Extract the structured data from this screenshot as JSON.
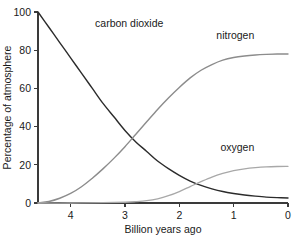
{
  "chart_data": {
    "type": "line",
    "title": "",
    "subtitle": "",
    "xlabel": "Billion years ago",
    "ylabel": "Percentage of atmosphere",
    "xlim": [
      4.6,
      0.0
    ],
    "ylim": [
      0,
      100
    ],
    "x_ticks": [
      4,
      3,
      2,
      1,
      0
    ],
    "x_tick_labels": [
      "4",
      "3",
      "2",
      "1",
      "0"
    ],
    "y_ticks": [
      0,
      20,
      40,
      60,
      80,
      100
    ],
    "y_tick_labels": [
      "0",
      "20",
      "40",
      "60",
      "80",
      "100"
    ],
    "x_axis_reversed": true,
    "grid": false,
    "legend": "inline-curve-labels",
    "background": "#ffffff",
    "series": [
      {
        "name": "carbon dioxide",
        "label": "carbon dioxide",
        "color": "#2b2b2b",
        "stroke_width": 1.4,
        "label_x": 3.55,
        "label_y": 92,
        "x": [
          4.6,
          4.4,
          4.2,
          4.0,
          3.8,
          3.6,
          3.4,
          3.2,
          3.0,
          2.8,
          2.6,
          2.4,
          2.2,
          2.0,
          1.8,
          1.6,
          1.4,
          1.2,
          1.0,
          0.8,
          0.6,
          0.4,
          0.2,
          0.0
        ],
        "y": [
          100,
          92,
          84,
          76,
          68,
          60,
          52,
          45,
          38,
          32,
          27,
          22,
          18,
          14.5,
          11.5,
          9.2,
          7.4,
          6.0,
          5.0,
          4.2,
          3.6,
          3.1,
          2.8,
          2.6
        ]
      },
      {
        "name": "nitrogen",
        "label": "nitrogen",
        "color": "#8c8c8c",
        "stroke_width": 1.4,
        "label_x": 0.62,
        "label_y": 86,
        "x": [
          4.6,
          4.4,
          4.2,
          4.0,
          3.8,
          3.6,
          3.4,
          3.2,
          3.0,
          2.8,
          2.6,
          2.4,
          2.2,
          2.0,
          1.8,
          1.6,
          1.4,
          1.2,
          1.0,
          0.8,
          0.6,
          0.4,
          0.2,
          0.0
        ],
        "y": [
          0,
          0.8,
          2.5,
          5.0,
          8.5,
          13.0,
          18.0,
          23.5,
          29.5,
          36.0,
          42.5,
          49.0,
          55.0,
          60.5,
          65.5,
          69.5,
          72.5,
          74.8,
          76.2,
          77.0,
          77.5,
          77.8,
          78.0,
          78.0
        ]
      },
      {
        "name": "oxygen",
        "label": "oxygen",
        "color": "#a8a8a8",
        "stroke_width": 1.3,
        "label_x": 0.62,
        "label_y": 27,
        "x": [
          4.6,
          4.0,
          3.4,
          3.0,
          2.8,
          2.6,
          2.4,
          2.2,
          2.0,
          1.8,
          1.6,
          1.4,
          1.2,
          1.0,
          0.8,
          0.6,
          0.4,
          0.2,
          0.0
        ],
        "y": [
          0,
          0,
          0.2,
          0.4,
          0.7,
          1.2,
          2.2,
          3.8,
          6.0,
          8.6,
          11.2,
          13.6,
          15.5,
          17.0,
          17.9,
          18.5,
          18.9,
          19.1,
          19.2
        ]
      }
    ]
  },
  "geometry": {
    "plot_left": 38,
    "plot_right": 288,
    "plot_top": 12,
    "plot_bottom": 203
  }
}
